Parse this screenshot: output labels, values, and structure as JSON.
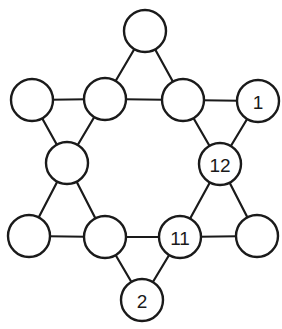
{
  "diagram": {
    "title": "",
    "type": "hexagram-number-puzzle",
    "colors": {
      "stroke": "#1a1a1a",
      "fill": "#ffffff",
      "background": "#ffffff"
    },
    "node_radius": 21,
    "nodes": [
      {
        "id": "n0",
        "x": 145,
        "y": 31,
        "label": ""
      },
      {
        "id": "n1",
        "x": 32,
        "y": 100,
        "label": ""
      },
      {
        "id": "n2",
        "x": 105,
        "y": 99,
        "label": ""
      },
      {
        "id": "n3",
        "x": 183,
        "y": 100,
        "label": ""
      },
      {
        "id": "n4",
        "x": 258,
        "y": 101,
        "label": "1"
      },
      {
        "id": "n5",
        "x": 67,
        "y": 163,
        "label": ""
      },
      {
        "id": "n6",
        "x": 220,
        "y": 164,
        "label": "12"
      },
      {
        "id": "n7",
        "x": 29,
        "y": 236,
        "label": ""
      },
      {
        "id": "n8",
        "x": 105,
        "y": 237,
        "label": ""
      },
      {
        "id": "n9",
        "x": 180,
        "y": 237,
        "label": "11"
      },
      {
        "id": "n10",
        "x": 257,
        "y": 236,
        "label": ""
      },
      {
        "id": "n11",
        "x": 142,
        "y": 300,
        "label": "2"
      }
    ],
    "edges": [
      [
        "n0",
        "n2"
      ],
      [
        "n0",
        "n3"
      ],
      [
        "n1",
        "n2"
      ],
      [
        "n2",
        "n3"
      ],
      [
        "n3",
        "n4"
      ],
      [
        "n1",
        "n5"
      ],
      [
        "n2",
        "n5"
      ],
      [
        "n3",
        "n6"
      ],
      [
        "n4",
        "n6"
      ],
      [
        "n5",
        "n7"
      ],
      [
        "n5",
        "n8"
      ],
      [
        "n6",
        "n9"
      ],
      [
        "n6",
        "n10"
      ],
      [
        "n7",
        "n8"
      ],
      [
        "n8",
        "n9"
      ],
      [
        "n9",
        "n10"
      ],
      [
        "n8",
        "n11"
      ],
      [
        "n9",
        "n11"
      ]
    ]
  }
}
